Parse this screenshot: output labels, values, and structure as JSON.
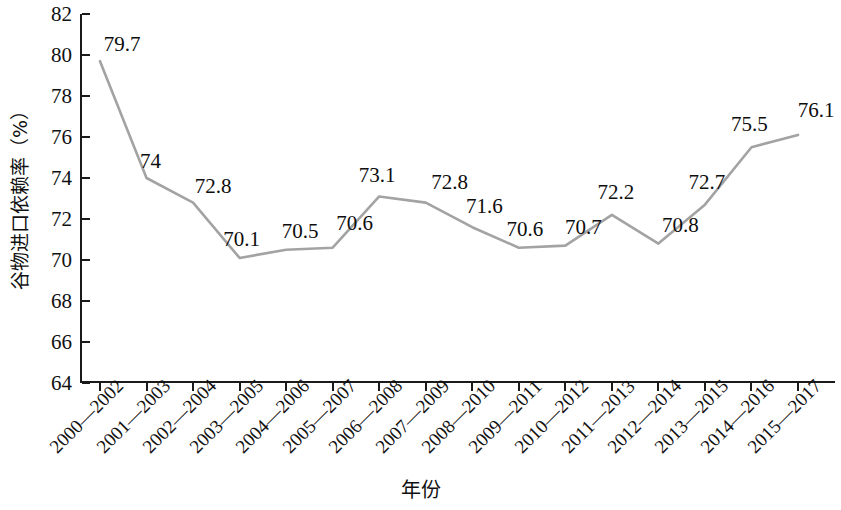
{
  "chart_data": {
    "type": "line",
    "title": "",
    "xlabel": "年份",
    "ylabel": "谷物进口依赖率（%）",
    "ylim": [
      64,
      82
    ],
    "ytick_step": 2,
    "yticks": [
      64,
      66,
      68,
      70,
      72,
      74,
      76,
      78,
      80,
      82
    ],
    "grid": false,
    "legend": false,
    "line_color": "#a3a3a3",
    "label_color": "#0d0d0d",
    "axis_color": "#1a1a1a",
    "categories": [
      "2000—2002",
      "2001—2003",
      "2002—2004",
      "2003—2005",
      "2004—2006",
      "2005—2007",
      "2006—2008",
      "2007—2009",
      "2008—2010",
      "2009—2011",
      "2010—2012",
      "2011—2013",
      "2012—2014",
      "2013—2015",
      "2014—2016",
      "2015—2017"
    ],
    "values": [
      79.7,
      74,
      72.8,
      70.1,
      70.5,
      70.6,
      73.1,
      72.8,
      71.6,
      70.6,
      70.7,
      72.2,
      70.8,
      72.7,
      75.5,
      76.1
    ],
    "value_labels": [
      "79.7",
      "74",
      "72.8",
      "70.1",
      "70.5",
      "70.6",
      "73.1",
      "72.8",
      "71.6",
      "70.6",
      "70.7",
      "72.2",
      "70.8",
      "72.7",
      "75.5",
      "76.1"
    ]
  }
}
